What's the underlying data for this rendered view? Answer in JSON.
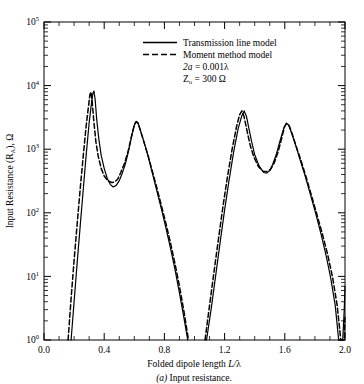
{
  "figure": {
    "caption_prefix": "(a)",
    "caption_text": " Input resistance."
  },
  "axes": {
    "xlabel_main": "Folded dipole length ",
    "xlabel_italic": "L/",
    "xlabel_lambda": "λ",
    "ylabel_pre": "Input Resistance (R",
    "ylabel_sub": "A",
    "ylabel_post": "), Ω",
    "x_ticks": [
      "0.0",
      "0.4",
      "0.8",
      "1.2",
      "1.6",
      "2.0"
    ],
    "y_ticks": [
      "10",
      "10",
      "10",
      "10",
      "10",
      "10"
    ],
    "y_exponents": [
      "0",
      "1",
      "2",
      "3",
      "4",
      "5"
    ]
  },
  "legend": {
    "entry_solid": "Transmission line model",
    "entry_dashed": "Moment method model",
    "param1_italic": "2a",
    "param1_rest": " = 0.001λ",
    "param2_pre": "Z",
    "param2_sub": "o",
    "param2_rest": " = 300 Ω"
  },
  "chart_data": {
    "type": "line",
    "title": "(a) Input resistance.",
    "xlabel": "Folded dipole length L/λ",
    "ylabel": "Input Resistance (R_A), Ω",
    "xlim": [
      0.0,
      2.0
    ],
    "ylim": [
      1,
      100000
    ],
    "yscale": "log",
    "grid": false,
    "legend_position": "top-center",
    "xticks": [
      0.0,
      0.4,
      0.8,
      1.2,
      1.6,
      2.0
    ],
    "yticks": [
      1,
      10,
      100,
      1000,
      10000,
      100000
    ],
    "annotations": [
      "2a = 0.001λ",
      "Z_o = 300 Ω"
    ],
    "series": [
      {
        "name": "Transmission line model",
        "style": "solid",
        "color": "#000000",
        "points": [
          [
            0.18,
            1.0
          ],
          [
            0.2,
            4.0
          ],
          [
            0.22,
            16
          ],
          [
            0.24,
            60
          ],
          [
            0.26,
            220
          ],
          [
            0.28,
            800
          ],
          [
            0.3,
            2600
          ],
          [
            0.315,
            5200
          ],
          [
            0.325,
            7600
          ],
          [
            0.332,
            8200
          ],
          [
            0.34,
            6000
          ],
          [
            0.35,
            3000
          ],
          [
            0.365,
            1400
          ],
          [
            0.38,
            800
          ],
          [
            0.4,
            500
          ],
          [
            0.42,
            350
          ],
          [
            0.44,
            280
          ],
          [
            0.46,
            255
          ],
          [
            0.48,
            270
          ],
          [
            0.5,
            320
          ],
          [
            0.52,
            420
          ],
          [
            0.54,
            580
          ],
          [
            0.56,
            900
          ],
          [
            0.58,
            1500
          ],
          [
            0.6,
            2400
          ],
          [
            0.612,
            2750
          ],
          [
            0.625,
            2600
          ],
          [
            0.64,
            2000
          ],
          [
            0.66,
            1400
          ],
          [
            0.69,
            800
          ],
          [
            0.72,
            420
          ],
          [
            0.75,
            220
          ],
          [
            0.78,
            115
          ],
          [
            0.81,
            58
          ],
          [
            0.84,
            28
          ],
          [
            0.87,
            13
          ],
          [
            0.9,
            5.5
          ],
          [
            0.93,
            2.2
          ],
          [
            0.955,
            1.0
          ],
          [
            1.08,
            1.0
          ],
          [
            1.11,
            3.0
          ],
          [
            1.14,
            10
          ],
          [
            1.17,
            34
          ],
          [
            1.2,
            110
          ],
          [
            1.23,
            330
          ],
          [
            1.26,
            900
          ],
          [
            1.29,
            2100
          ],
          [
            1.315,
            3400
          ],
          [
            1.33,
            4000
          ],
          [
            1.345,
            3300
          ],
          [
            1.36,
            2200
          ],
          [
            1.38,
            1300
          ],
          [
            1.4,
            820
          ],
          [
            1.43,
            540
          ],
          [
            1.46,
            430
          ],
          [
            1.48,
            420
          ],
          [
            1.5,
            460
          ],
          [
            1.52,
            580
          ],
          [
            1.545,
            850
          ],
          [
            1.57,
            1400
          ],
          [
            1.595,
            2200
          ],
          [
            1.61,
            2560
          ],
          [
            1.625,
            2400
          ],
          [
            1.645,
            1800
          ],
          [
            1.67,
            1200
          ],
          [
            1.7,
            700
          ],
          [
            1.735,
            380
          ],
          [
            1.77,
            195
          ],
          [
            1.805,
            98
          ],
          [
            1.84,
            47
          ],
          [
            1.875,
            21
          ],
          [
            1.905,
            9.5
          ],
          [
            1.935,
            3.5
          ],
          [
            1.958,
            1.0
          ],
          [
            1.985,
            1.0
          ],
          [
            1.995,
            3.0
          ],
          [
            2.0,
            7.0
          ]
        ]
      },
      {
        "name": "Moment method model",
        "style": "dashed",
        "color": "#000000",
        "points": [
          [
            0.16,
            1.0
          ],
          [
            0.18,
            4.5
          ],
          [
            0.2,
            18
          ],
          [
            0.22,
            65
          ],
          [
            0.24,
            230
          ],
          [
            0.26,
            750
          ],
          [
            0.28,
            2300
          ],
          [
            0.295,
            4600
          ],
          [
            0.305,
            7200
          ],
          [
            0.312,
            8000
          ],
          [
            0.32,
            5600
          ],
          [
            0.332,
            2600
          ],
          [
            0.345,
            1300
          ],
          [
            0.36,
            780
          ],
          [
            0.38,
            500
          ],
          [
            0.4,
            380
          ],
          [
            0.425,
            320
          ],
          [
            0.45,
            300
          ],
          [
            0.47,
            305
          ],
          [
            0.49,
            340
          ],
          [
            0.51,
            430
          ],
          [
            0.535,
            600
          ],
          [
            0.56,
            950
          ],
          [
            0.58,
            1550
          ],
          [
            0.6,
            2400
          ],
          [
            0.612,
            2700
          ],
          [
            0.625,
            2550
          ],
          [
            0.64,
            1980
          ],
          [
            0.66,
            1400
          ],
          [
            0.69,
            820
          ],
          [
            0.72,
            450
          ],
          [
            0.75,
            245
          ],
          [
            0.78,
            130
          ],
          [
            0.81,
            68
          ],
          [
            0.84,
            34
          ],
          [
            0.87,
            16
          ],
          [
            0.9,
            7.0
          ],
          [
            0.93,
            2.8
          ],
          [
            0.96,
            1.0
          ],
          [
            1.07,
            1.0
          ],
          [
            1.1,
            3.5
          ],
          [
            1.13,
            12
          ],
          [
            1.16,
            40
          ],
          [
            1.19,
            130
          ],
          [
            1.22,
            380
          ],
          [
            1.25,
            1000
          ],
          [
            1.28,
            2300
          ],
          [
            1.3,
            3500
          ],
          [
            1.315,
            4000
          ],
          [
            1.33,
            3200
          ],
          [
            1.35,
            1900
          ],
          [
            1.37,
            1150
          ],
          [
            1.395,
            750
          ],
          [
            1.425,
            530
          ],
          [
            1.455,
            450
          ],
          [
            1.48,
            445
          ],
          [
            1.505,
            480
          ],
          [
            1.53,
            610
          ],
          [
            1.555,
            900
          ],
          [
            1.578,
            1450
          ],
          [
            1.598,
            2250
          ],
          [
            1.612,
            2550
          ],
          [
            1.628,
            2380
          ],
          [
            1.648,
            1780
          ],
          [
            1.672,
            1180
          ],
          [
            1.705,
            690
          ],
          [
            1.74,
            375
          ],
          [
            1.775,
            195
          ],
          [
            1.81,
            100
          ],
          [
            1.848,
            48
          ],
          [
            1.885,
            22
          ],
          [
            1.918,
            9.5
          ],
          [
            1.948,
            3.5
          ],
          [
            1.972,
            1.0
          ],
          [
            1.995,
            1.0
          ],
          [
            2.0,
            2.5
          ]
        ]
      }
    ]
  },
  "geometry": {
    "plot_left": 44,
    "plot_right": 345,
    "plot_top": 22,
    "plot_bottom": 340
  }
}
